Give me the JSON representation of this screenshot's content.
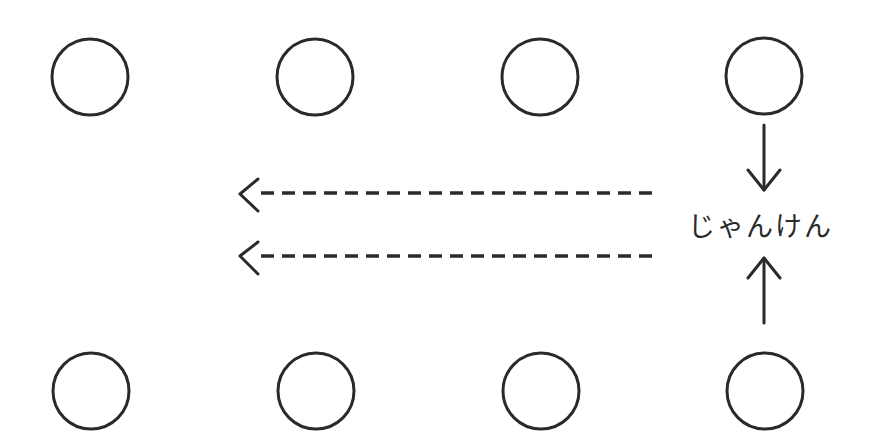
{
  "diagram": {
    "label": "じゃんけん",
    "stroke_color": "#2a2a2a",
    "background": "#ffffff",
    "top_row": [
      {
        "id": "top-1",
        "cx": 90,
        "cy": 77
      },
      {
        "id": "top-2",
        "cx": 315,
        "cy": 77
      },
      {
        "id": "top-3",
        "cx": 540,
        "cy": 77
      },
      {
        "id": "top-4",
        "cx": 764,
        "cy": 76
      }
    ],
    "bottom_row": [
      {
        "id": "bottom-1",
        "cx": 91,
        "cy": 391
      },
      {
        "id": "bottom-2",
        "cx": 316,
        "cy": 391
      },
      {
        "id": "bottom-3",
        "cx": 541,
        "cy": 391
      },
      {
        "id": "bottom-4",
        "cx": 765,
        "cy": 391
      }
    ],
    "circle_radius": 38,
    "arrows": {
      "down": {
        "x": 764,
        "y1": 125,
        "y2": 190
      },
      "up": {
        "x": 764,
        "y1": 323,
        "y2": 258
      },
      "dashed_left": [
        {
          "y": 193,
          "x_start": 652,
          "x_end": 238
        },
        {
          "y": 257,
          "x_start": 652,
          "x_end": 238
        }
      ]
    }
  }
}
